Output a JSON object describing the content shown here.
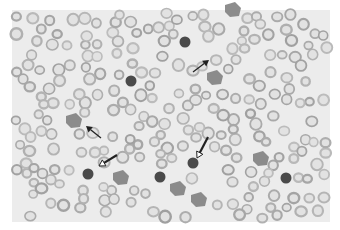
{
  "image": {
    "kind": "grayscale blood smear micrograph",
    "background": "#ffffff",
    "field_color": "#ececec",
    "rbc_ring_color": "#a9a9a9",
    "rbc_center_color": "#e2e2e2",
    "dark_cell_color": "#4a4a4a",
    "atypical_cell_color": "#7a7a7a",
    "field_bounds": {
      "x": 12,
      "y": 10,
      "width": 318,
      "height": 212
    }
  },
  "annotations": [
    {
      "type": "solid-arrow",
      "label": "solid arrow",
      "tip": [
        86,
        126
      ],
      "tail": [
        101,
        138
      ]
    },
    {
      "type": "solid-arrow",
      "label": "solid arrow",
      "tip": [
        209,
        60
      ],
      "tail": [
        193,
        72
      ]
    },
    {
      "type": "open-arrow",
      "label": "open arrow",
      "tip": [
        99,
        166
      ],
      "tail": [
        117,
        155
      ]
    },
    {
      "type": "open-arrow",
      "label": "open arrow",
      "tip": [
        197,
        158
      ],
      "tail": [
        208,
        137
      ]
    }
  ],
  "cells": {
    "dark_round": [
      [
        131,
        81
      ],
      [
        88,
        174
      ],
      [
        193,
        163
      ],
      [
        185,
        42
      ],
      [
        286,
        178
      ],
      [
        160,
        177
      ]
    ],
    "atypical": [
      [
        74,
        121
      ],
      [
        215,
        78
      ],
      [
        261,
        159
      ],
      [
        121,
        178
      ],
      [
        199,
        200
      ],
      [
        178,
        189
      ],
      [
        233,
        10
      ]
    ]
  }
}
